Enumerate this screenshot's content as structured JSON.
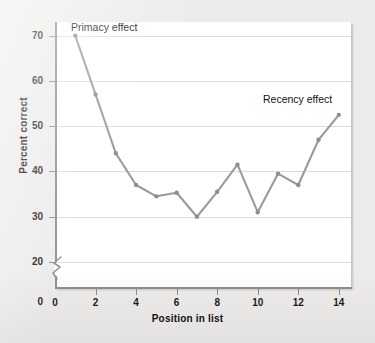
{
  "figure": {
    "background_color": "#eeecea",
    "plot_background_color": "#ffffff",
    "line_color": "#9b9b9b",
    "marker_color": "#8f8f8f",
    "grid_color": "#dcdcdc",
    "axis_color": "#8d8d8d",
    "text_color": "#141414"
  },
  "chart_data": {
    "type": "line",
    "title": "",
    "xlabel": "Position in list",
    "ylabel": "Percent correct",
    "x": [
      1,
      2,
      3,
      4,
      5,
      6,
      7,
      8,
      9,
      10,
      11,
      12,
      13,
      14
    ],
    "values": [
      70,
      57,
      44,
      37,
      34.5,
      35.3,
      30,
      35.5,
      41.5,
      31,
      39.5,
      37,
      47,
      52.5
    ],
    "series": [
      {
        "name": "Percent correct",
        "values": [
          70,
          57,
          44,
          37,
          34.5,
          35.3,
          30,
          35.5,
          41.5,
          31,
          39.5,
          37,
          47,
          52.5
        ]
      }
    ],
    "xlim": [
      0,
      14.6
    ],
    "ylim": [
      20,
      73
    ],
    "xticks": [
      0,
      2,
      4,
      6,
      8,
      10,
      12,
      14
    ],
    "xtick_labels": [
      "0",
      "2",
      "4",
      "6",
      "8",
      "10",
      "12",
      "14"
    ],
    "yticks": [
      20,
      30,
      40,
      50,
      60,
      70
    ],
    "ytick_labels": [
      "20",
      "30",
      "40",
      "50",
      "60",
      "70"
    ],
    "y_axis_break": true,
    "y_axis_break_from": 0,
    "y_axis_break_to": 20,
    "grid": "horizontal",
    "legend": "none",
    "markers": true,
    "annotations": [
      {
        "text": "Primacy effect",
        "x": 1,
        "y": 72.5
      },
      {
        "text": "Recency effect",
        "x": 12.9,
        "y": 55.5
      }
    ]
  }
}
